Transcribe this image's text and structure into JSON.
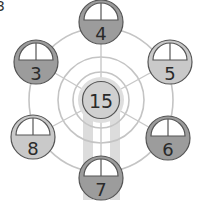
{
  "figure": {
    "corner_label": "3",
    "hub": {
      "value": "15",
      "fill": "#d0d0d0",
      "halo": "#dedede"
    },
    "gondolas": [
      {
        "position": "top",
        "value": "4",
        "fill": "#9c9c9c"
      },
      {
        "position": "upper-right",
        "value": "5",
        "fill": "#c9c9c9"
      },
      {
        "position": "lower-right",
        "value": "6",
        "fill": "#9c9c9c"
      },
      {
        "position": "bottom",
        "value": "7",
        "fill": "#9c9c9c"
      },
      {
        "position": "lower-left",
        "value": "8",
        "fill": "#c9c9c9"
      },
      {
        "position": "upper-left",
        "value": "3",
        "fill": "#9c9c9c"
      }
    ],
    "colors": {
      "rim": "#c4c4c4",
      "spoke": "#c8c8c8",
      "support_legs": "#dcdcdc",
      "outline": "#555555"
    }
  }
}
